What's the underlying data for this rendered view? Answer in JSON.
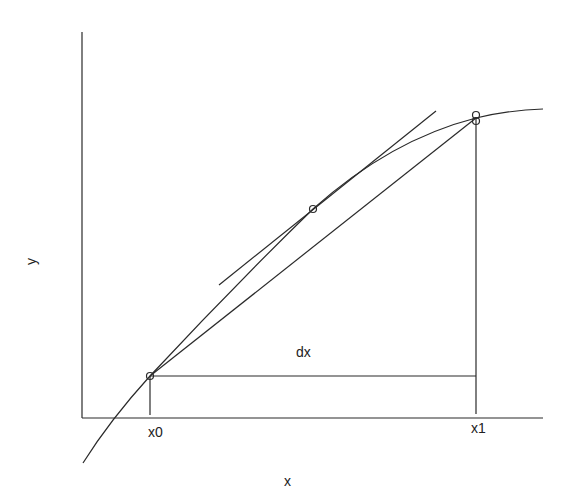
{
  "diagram": {
    "title": "",
    "axes": {
      "x_label": "x",
      "y_label": "y"
    },
    "tick_labels": {
      "x0": "x0",
      "x1": "x1"
    },
    "annotation": {
      "dx": "dx"
    },
    "elements": {
      "curve": "concave increasing function curve",
      "secant": "secant line from (x0, f(x0)) to (x1, f(x1))",
      "tangent": "tangent line at midpoint",
      "points": [
        "point at x0",
        "point at midpoint",
        "point at x1 (curve)",
        "point at x1 (secant)"
      ]
    },
    "colors": {
      "line": "#2a2a2a",
      "background": "#ffffff"
    }
  }
}
